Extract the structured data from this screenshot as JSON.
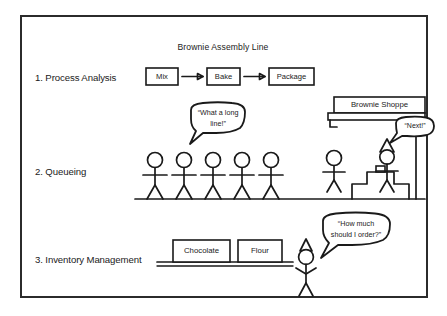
{
  "figure": {
    "title": "Brownie Assembly Line",
    "rows": [
      {
        "id": "process-analysis",
        "label": "1. Process Analysis",
        "steps": [
          "Mix",
          "Bake",
          "Package"
        ]
      },
      {
        "id": "queueing",
        "label": "2. Queueing",
        "shop_sign": "Brownie Shoppe",
        "customer_count": 5,
        "staff_count": 2,
        "bubbles": [
          {
            "id": "long-line",
            "text_line1": "“What a long",
            "text_line2": "line!”"
          },
          {
            "id": "next",
            "text_line1": "“Next!”"
          }
        ]
      },
      {
        "id": "inventory-management",
        "label": "3. Inventory Management",
        "shelf_items": [
          "Chocolate",
          "Flour"
        ],
        "bubbles": [
          {
            "id": "how-much",
            "text_line1": "“How much",
            "text_line2": "should I order?”"
          }
        ]
      }
    ],
    "colors": {
      "ink": "#1a1a1a",
      "frame": "#2b2b2b",
      "background": "#ffffff"
    }
  }
}
